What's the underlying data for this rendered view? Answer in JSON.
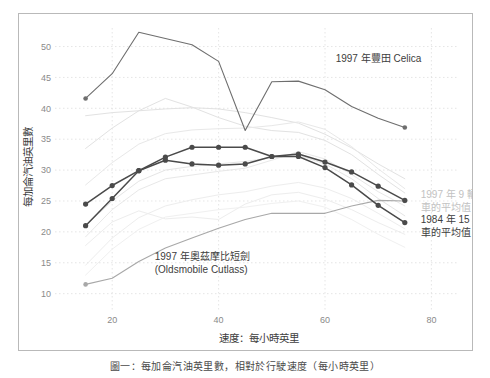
{
  "chart_data": {
    "type": "line",
    "title": "",
    "xlabel": "速度：每小時英里",
    "ylabel": "每加侖汽油英里數",
    "xlim": [
      10,
      85
    ],
    "ylim": [
      8,
      53
    ],
    "xticks": [
      20,
      40,
      60,
      80
    ],
    "yticks": [
      10,
      15,
      20,
      25,
      30,
      35,
      40,
      45,
      50
    ],
    "grid": true,
    "legend_position": "inline-annotations",
    "annotations": [
      {
        "id": "celica",
        "text": "1997 年豐田 Celica",
        "x": 62,
        "y": 47.5,
        "color": "#5c5c5c"
      },
      {
        "id": "cutlass",
        "text_line1": "1997 年奧茲摩比短劍",
        "text_line2": "(Oldsmobile Cutlass)",
        "x": 28,
        "y": 15.5,
        "color": "#5c5c5c"
      },
      {
        "id": "avg1997",
        "text_line1": "1997 年 9 輛",
        "text_line2": "車的平均值",
        "x": 78,
        "y": 25.5,
        "color": "#c2c2c2"
      },
      {
        "id": "avg1984",
        "text_line1": "1984 年 15 輛",
        "text_line2": "車的平均值",
        "x": 78,
        "y": 21.5,
        "color": "#4a4a4a"
      }
    ],
    "series": [
      {
        "name": "1997 年豐田 Celica",
        "color": "#6e6e6e",
        "emphasis": "medium",
        "markers": "sparse",
        "x": [
          15,
          20,
          25,
          30,
          35,
          40,
          45,
          50,
          55,
          60,
          65,
          70,
          75
        ],
        "y": [
          41.6,
          45.6,
          52.3,
          51.3,
          50.3,
          47.6,
          36.4,
          44.3,
          44.4,
          43.0,
          40.3,
          38.4,
          36.9
        ]
      },
      {
        "name": "1997 年奧茲摩比短劍 (Oldsmobile Cutlass)",
        "color": "#a8a8a8",
        "emphasis": "medium",
        "markers": "sparse",
        "x": [
          15,
          20,
          25,
          30,
          35,
          40,
          45,
          50,
          55,
          60,
          65,
          70,
          75
        ],
        "y": [
          11.5,
          12.5,
          15.2,
          17.4,
          19.0,
          20.6,
          22.0,
          23.0,
          23.0,
          23.0,
          24.2,
          25.1,
          25.0
        ]
      },
      {
        "name": "1984 年 15 輛車的平均值",
        "color": "#4a4a4a",
        "emphasis": "dark",
        "markers": "all",
        "x": [
          15,
          20,
          25,
          30,
          35,
          40,
          45,
          50,
          55,
          60,
          65,
          70,
          75
        ],
        "y": [
          21.0,
          25.4,
          29.9,
          31.6,
          31.0,
          30.8,
          31.0,
          32.2,
          32.2,
          30.4,
          27.6,
          24.3,
          21.5
        ]
      },
      {
        "name": "1997 年 9 輛車的平均值",
        "color": "#4a4a4a",
        "emphasis": "dark",
        "markers": "all",
        "x": [
          15,
          20,
          25,
          30,
          35,
          40,
          45,
          50,
          55,
          60,
          65,
          70,
          75
        ],
        "y": [
          24.5,
          27.5,
          29.9,
          32.1,
          33.7,
          33.7,
          33.7,
          32.2,
          32.6,
          31.3,
          29.7,
          27.4,
          25.1
        ]
      },
      {
        "name": "background-vehicle-1",
        "color": "#e2e2e2",
        "emphasis": "light",
        "markers": "none",
        "x": [
          15,
          20,
          25,
          30,
          35,
          40,
          45,
          50,
          55,
          60,
          65,
          70,
          75
        ],
        "y": [
          38.8,
          39.3,
          39.6,
          39.9,
          40.1,
          39.9,
          39.3,
          38.5,
          37.6,
          35.8,
          33.6,
          31.0,
          28.6
        ]
      },
      {
        "name": "background-vehicle-2",
        "color": "#e2e2e2",
        "emphasis": "light",
        "markers": "none",
        "x": [
          15,
          20,
          25,
          30,
          35,
          40,
          45,
          50,
          55,
          60,
          65,
          70,
          75
        ],
        "y": [
          33.5,
          36.8,
          39.6,
          41.6,
          40.2,
          38.5,
          37.1,
          36.4,
          36.1,
          34.8,
          32.5,
          29.3,
          26.3
        ]
      },
      {
        "name": "background-vehicle-3",
        "color": "#e8e8e8",
        "emphasis": "light",
        "markers": "none",
        "x": [
          15,
          20,
          25,
          30,
          35,
          40,
          45,
          50,
          55,
          60,
          65,
          70,
          75
        ],
        "y": [
          27.6,
          31.2,
          34.2,
          35.9,
          36.5,
          36.7,
          36.8,
          37.2,
          37.8,
          36.6,
          33.8,
          30.2,
          27.0
        ]
      },
      {
        "name": "background-vehicle-4",
        "color": "#e8e8e8",
        "emphasis": "light",
        "markers": "none",
        "x": [
          15,
          20,
          25,
          30,
          35,
          40,
          45,
          50,
          55,
          60,
          65,
          70,
          75
        ],
        "y": [
          19.2,
          23.6,
          26.8,
          28.6,
          29.2,
          29.8,
          30.3,
          31.6,
          33.0,
          31.8,
          29.3,
          26.5,
          24.2
        ]
      },
      {
        "name": "background-vehicle-5",
        "color": "#ededed",
        "emphasis": "light",
        "markers": "none",
        "x": [
          15,
          20,
          25,
          30,
          35,
          40,
          45,
          50,
          55,
          60,
          65,
          70,
          75
        ],
        "y": [
          17.8,
          21.6,
          23.4,
          22.1,
          22.4,
          22.0,
          24.5,
          26.0,
          26.4,
          25.3,
          23.6,
          21.5,
          19.6
        ]
      },
      {
        "name": "background-vehicle-6",
        "color": "#ededed",
        "emphasis": "light",
        "markers": "none",
        "x": [
          15,
          20,
          25,
          30,
          35,
          40,
          45,
          50,
          55,
          60,
          65,
          70,
          75
        ],
        "y": [
          14.6,
          19.0,
          22.3,
          24.2,
          25.2,
          26.0,
          26.5,
          27.4,
          28.0,
          27.1,
          25.4,
          23.0,
          20.5
        ]
      },
      {
        "name": "background-vehicle-7",
        "color": "#f0f0f0",
        "emphasis": "light",
        "markers": "none",
        "x": [
          15,
          20,
          25,
          30,
          35,
          40,
          45,
          50,
          55,
          60,
          65,
          70,
          75
        ],
        "y": [
          13.0,
          17.2,
          20.4,
          22.4,
          23.0,
          23.6,
          24.0,
          24.6,
          25.0,
          24.0,
          22.0,
          19.6,
          17.5
        ]
      },
      {
        "name": "background-vehicle-8",
        "color": "#e5e5e5",
        "emphasis": "light",
        "markers": "none",
        "x": [
          15,
          20,
          25,
          30,
          35,
          40,
          45,
          50,
          55,
          60,
          65,
          70,
          75
        ],
        "y": [
          21.0,
          25.0,
          28.2,
          30.0,
          30.6,
          31.0,
          31.4,
          32.0,
          32.4,
          31.0,
          28.6,
          25.4,
          22.6
        ]
      }
    ]
  },
  "caption": {
    "text": "圖一：每加侖汽油英里數，相對於行駛速度（每小時英里）"
  }
}
